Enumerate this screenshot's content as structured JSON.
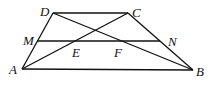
{
  "diagram": {
    "type": "geometry",
    "points": {
      "A": {
        "label": "A",
        "x": 22,
        "y": 69
      },
      "B": {
        "label": "B",
        "x": 193,
        "y": 70
      },
      "C": {
        "label": "C",
        "x": 128,
        "y": 13
      },
      "D": {
        "label": "D",
        "x": 53,
        "y": 13
      },
      "M": {
        "label": "M",
        "x": 37,
        "y": 41
      },
      "N": {
        "label": "N",
        "x": 160,
        "y": 41
      },
      "E": {
        "label": "E",
        "x": 75,
        "y": 41
      },
      "F": {
        "label": "F",
        "x": 122,
        "y": 41
      }
    },
    "segments": [
      [
        "A",
        "B"
      ],
      [
        "B",
        "C"
      ],
      [
        "C",
        "D"
      ],
      [
        "D",
        "A"
      ],
      [
        "A",
        "C"
      ],
      [
        "B",
        "D"
      ],
      [
        "M",
        "N"
      ]
    ],
    "label_positions": {
      "A": {
        "x": 9,
        "y": 74
      },
      "B": {
        "x": 196,
        "y": 76
      },
      "C": {
        "x": 132,
        "y": 17
      },
      "D": {
        "x": 40,
        "y": 16
      },
      "M": {
        "x": 23,
        "y": 45
      },
      "N": {
        "x": 168,
        "y": 46
      },
      "E": {
        "x": 72,
        "y": 57
      },
      "F": {
        "x": 114,
        "y": 57
      }
    },
    "stroke_color": "#111111"
  }
}
